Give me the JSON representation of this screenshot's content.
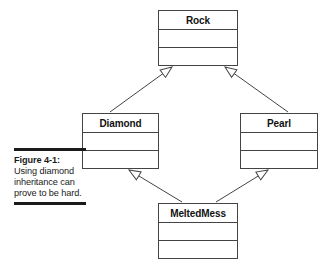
{
  "figure": {
    "caption_label": "Figure 4-1:",
    "caption_body": "Using diamond inheritance can prove to be hard."
  },
  "diagram": {
    "type": "uml-class-diagram",
    "relationship": "generalization",
    "classes": [
      {
        "id": "rock",
        "name": "Rock",
        "compartments": 3
      },
      {
        "id": "diamond",
        "name": "Diamond",
        "compartments": 3
      },
      {
        "id": "pearl",
        "name": "Pearl",
        "compartments": 3
      },
      {
        "id": "meltedmess",
        "name": "MeltedMess",
        "compartments": 3
      }
    ],
    "edges": [
      {
        "from": "Diamond",
        "to": "Rock",
        "arrow": "hollow-triangle"
      },
      {
        "from": "Pearl",
        "to": "Rock",
        "arrow": "hollow-triangle"
      },
      {
        "from": "MeltedMess",
        "to": "Diamond",
        "arrow": "hollow-triangle"
      },
      {
        "from": "MeltedMess",
        "to": "Pearl",
        "arrow": "hollow-triangle"
      }
    ]
  },
  "colors": {
    "line": "#444444",
    "text": "#111111",
    "rule": "#1a1a1a",
    "background": "#ffffff"
  }
}
